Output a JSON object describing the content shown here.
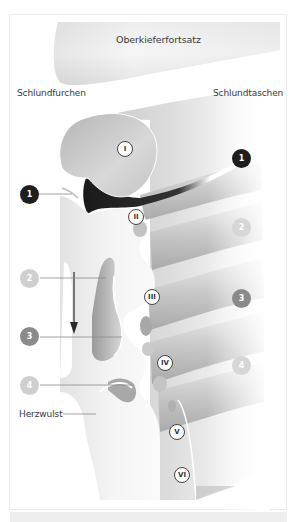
{
  "labels": {
    "maxillary_process": "Oberkieferfortsatz",
    "pharyngeal_grooves": "Schlundfurchen",
    "pharyngeal_pouches": "Schlundtaschen",
    "cardiac_bulge": "Herzwulst"
  },
  "arches": [
    {
      "numeral": "I"
    },
    {
      "numeral": "II"
    },
    {
      "numeral": "III"
    },
    {
      "numeral": "IV"
    },
    {
      "numeral": "V"
    },
    {
      "numeral": "VI"
    }
  ],
  "grooves_left": [
    {
      "number": "1",
      "color": "#1e1e1e"
    },
    {
      "number": "2",
      "color": "#cfcfcf"
    },
    {
      "number": "3",
      "color": "#8a8a8a"
    },
    {
      "number": "4",
      "color": "#cfcfcf"
    }
  ],
  "pouches_right": [
    {
      "number": "1",
      "color": "#1e1e1e"
    },
    {
      "number": "2",
      "color": "#d6d6d6"
    },
    {
      "number": "3",
      "color": "#8a8a8a"
    },
    {
      "number": "4",
      "color": "#d6d6d6"
    }
  ],
  "colors": {
    "tissue_light": "#f4f4f4",
    "tissue_mid": "#c8c8c8",
    "tissue_dark": "#8e8e8e",
    "shadow": "#2a2a2a",
    "frame": "#ececec"
  }
}
